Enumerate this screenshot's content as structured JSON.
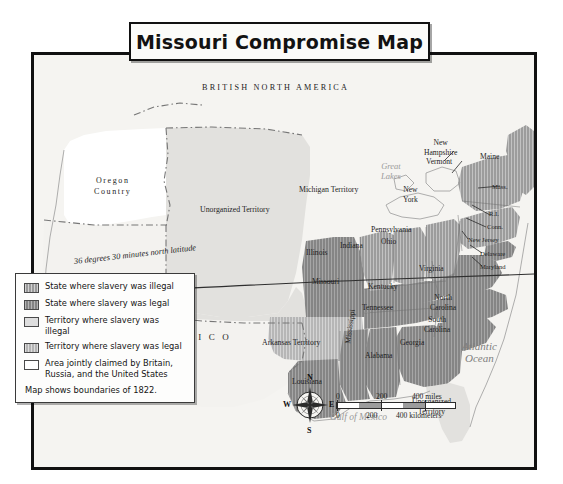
{
  "title": "Missouri Compromise Map",
  "legend": {
    "items": [
      {
        "label": "State where slavery was illegal",
        "swatch": "state-illegal",
        "color": "#9a9a9a"
      },
      {
        "label": "State where slavery was legal",
        "swatch": "state-legal",
        "color": "#848484"
      },
      {
        "label": "Territory where slavery was illegal",
        "swatch": "terr-illegal",
        "color": "#dedede"
      },
      {
        "label": "Territory where slavery was legal",
        "swatch": "terr-legal",
        "color": "#b4b4b4"
      },
      {
        "label": "Area jointly claimed by Britain, Russia, and the United States",
        "swatch": "joint",
        "color": "#ffffff"
      }
    ],
    "note": "Map shows boundaries of 1822."
  },
  "map_labels": {
    "regions": [
      {
        "name": "british-north-america",
        "text": "BRITISH NORTH AMERICA"
      },
      {
        "name": "mexico",
        "text": "M E X I C O"
      },
      {
        "name": "oregon-country",
        "line1": "Oregon",
        "line2": "Country"
      }
    ],
    "waters": [
      {
        "name": "pacific-ocean",
        "line1": "Pacific",
        "line2": "Ocean"
      },
      {
        "name": "atlantic-ocean",
        "line1": "Atlantic",
        "line2": "Ocean"
      },
      {
        "name": "gulf-of-mexico",
        "text": "Gulf of Mexico"
      },
      {
        "name": "great-lakes",
        "line1": "Great",
        "line2": "Lakes"
      }
    ],
    "territories": [
      {
        "name": "unorganized-territory",
        "text": "Unorganized Territory"
      },
      {
        "name": "michigan-territory",
        "text": "Michigan Territory"
      },
      {
        "name": "arkansas-territory",
        "text": "Arkansas Territory"
      },
      {
        "name": "unorganized-territory-florida",
        "line1": "Unorganized",
        "line2": "Territory"
      }
    ],
    "free_states": [
      {
        "name": "illinois",
        "text": "Illinois"
      },
      {
        "name": "indiana",
        "text": "Indiana"
      },
      {
        "name": "ohio",
        "text": "Ohio"
      },
      {
        "name": "pennsylvania",
        "text": "Pennsylvania"
      },
      {
        "name": "new-york",
        "line1": "New",
        "line2": "York"
      },
      {
        "name": "new-hampshire",
        "line1": "New",
        "line2": "Hampshire"
      },
      {
        "name": "vermont",
        "text": "Vermont"
      },
      {
        "name": "maine",
        "text": "Maine"
      },
      {
        "name": "massachusetts",
        "text": "Mass."
      },
      {
        "name": "rhode-island",
        "text": "R.I."
      },
      {
        "name": "connecticut",
        "text": "Conn."
      },
      {
        "name": "new-jersey",
        "text": "New Jersey"
      }
    ],
    "slave_states": [
      {
        "name": "missouri",
        "text": "Missouri"
      },
      {
        "name": "kentucky",
        "text": "Kentucky"
      },
      {
        "name": "virginia",
        "text": "Virginia"
      },
      {
        "name": "tennessee",
        "text": "Tennessee"
      },
      {
        "name": "north-carolina",
        "line1": "North",
        "line2": "Carolina"
      },
      {
        "name": "south-carolina",
        "line1": "South",
        "line2": "Carolina"
      },
      {
        "name": "georgia",
        "text": "Georgia"
      },
      {
        "name": "alabama",
        "text": "Alabama"
      },
      {
        "name": "mississippi",
        "text": "Mississippi"
      },
      {
        "name": "louisiana",
        "text": "Louisiana"
      },
      {
        "name": "delaware",
        "text": "Delaware"
      },
      {
        "name": "maryland",
        "text": "Maryland"
      }
    ],
    "latitude_line": "36 degrees 30 minutes north latitude"
  },
  "compass": {
    "north": "N",
    "south": "S",
    "east": "E",
    "west": "W"
  },
  "scale": {
    "miles": {
      "zero": "0",
      "mid": "200",
      "end": "400 miles"
    },
    "kilometers": {
      "zero": "0",
      "mid": "200",
      "end": "400 kilometers"
    }
  }
}
